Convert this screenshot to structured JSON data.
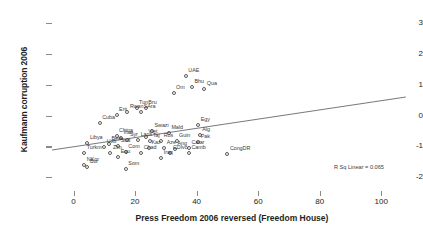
{
  "chart_data": {
    "type": "scatter",
    "title": "",
    "xlabel": "Press Freedom 2006 reversed (Freedom House)",
    "ylabel": "Kaufmann corruption 2006",
    "xlim": [
      -7,
      110
    ],
    "ylim": [
      -2.45,
      3.2
    ],
    "xticks": [
      0,
      20,
      40,
      60,
      80,
      100
    ],
    "yticks": [
      -2,
      -1,
      0,
      1,
      2,
      3
    ],
    "grid": false,
    "legend": null,
    "annotations": [
      {
        "name": "r-squared",
        "text": "R Sq Linear = 0.065",
        "x": 78,
        "y": -1.18
      }
    ],
    "fit_line": {
      "type": "linear",
      "x_start": -7,
      "y_start": -1.12,
      "x_end": 108,
      "y_end": 0.6
    },
    "points": [
      {
        "label": "UAE",
        "x": 36.5,
        "y": 1.28
      },
      {
        "label": "Bhu",
        "x": 38.5,
        "y": 0.92
      },
      {
        "label": "Qua",
        "x": 42.5,
        "y": 0.87
      },
      {
        "label": "Om",
        "x": 32.5,
        "y": 0.72
      },
      {
        "label": "Tun",
        "x": 20.5,
        "y": 0.26
      },
      {
        "label": "Bru",
        "x": 23.5,
        "y": 0.24
      },
      {
        "label": "SAra",
        "x": 22.0,
        "y": 0.13
      },
      {
        "label": "Rwan",
        "x": 17.5,
        "y": 0.13
      },
      {
        "label": "Erit",
        "x": 14.0,
        "y": 0.02
      },
      {
        "label": "Cuba",
        "x": 8.5,
        "y": -0.25
      },
      {
        "label": "Egy",
        "x": 40.5,
        "y": -0.31
      },
      {
        "label": "Swazi",
        "x": 25.5,
        "y": -0.5
      },
      {
        "label": "Mald",
        "x": 31.0,
        "y": -0.56
      },
      {
        "label": "Alg",
        "x": 41.0,
        "y": -0.62
      },
      {
        "label": "China",
        "x": 14.0,
        "y": -0.66
      },
      {
        "label": "Iran",
        "x": 15.5,
        "y": -0.72
      },
      {
        "label": "Viet",
        "x": 23.5,
        "y": -0.71
      },
      {
        "label": "Laos",
        "x": 21.0,
        "y": -0.78
      },
      {
        "label": "Syr",
        "x": 17.5,
        "y": -0.8
      },
      {
        "label": "Taj",
        "x": 25.0,
        "y": -0.83
      },
      {
        "label": "Rus",
        "x": 28.5,
        "y": -0.83
      },
      {
        "label": "Guin",
        "x": 33.5,
        "y": -0.84
      },
      {
        "label": "Pak",
        "x": 40.5,
        "y": -0.85
      },
      {
        "label": "Libya",
        "x": 4.5,
        "y": -0.9
      },
      {
        "label": "Bela",
        "x": 11.5,
        "y": -0.93
      },
      {
        "label": "Uzb",
        "x": 10.0,
        "y": -1.02
      },
      {
        "label": "Sud",
        "x": 14.5,
        "y": -1.0
      },
      {
        "label": "Aze",
        "x": 29.5,
        "y": -1.04
      },
      {
        "label": "Kaz",
        "x": 24.5,
        "y": -1.05
      },
      {
        "label": "Ang",
        "x": 33.0,
        "y": -1.08
      },
      {
        "label": "Catar",
        "x": 37.5,
        "y": -1.06
      },
      {
        "label": "Turkm",
        "x": 3.5,
        "y": -1.21
      },
      {
        "label": "Zim",
        "x": 12.0,
        "y": -1.2
      },
      {
        "label": "Com",
        "x": 17.0,
        "y": -1.17
      },
      {
        "label": "Chad",
        "x": 22.0,
        "y": -1.22
      },
      {
        "label": "CDIvo",
        "x": 31.5,
        "y": -1.21
      },
      {
        "label": "Camb",
        "x": 37.5,
        "y": -1.22
      },
      {
        "label": "CongDR",
        "x": 50.0,
        "y": -1.25
      },
      {
        "label": "Equ",
        "x": 14.5,
        "y": -1.33
      },
      {
        "label": "Iraq",
        "x": 28.5,
        "y": -1.39
      },
      {
        "label": "NKor",
        "x": 3.5,
        "y": -1.62
      },
      {
        "label": "Bur",
        "x": 4.5,
        "y": -1.67
      },
      {
        "label": "Som",
        "x": 17.0,
        "y": -1.73
      }
    ]
  },
  "axis": {
    "ylabel": "Kaufmann corruption 2006",
    "xlabel": "Press Freedom 2006 reversed (Freedom House)"
  }
}
